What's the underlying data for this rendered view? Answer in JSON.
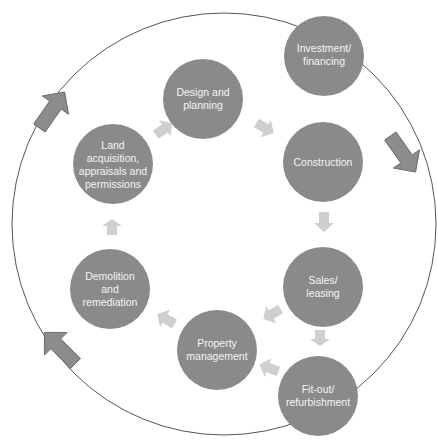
{
  "diagram": {
    "type": "cycle",
    "colors": {
      "node_fill": "#8a8a8a",
      "outer_ring": "#555555",
      "big_arrow_fill": "#8c8c8c",
      "big_arrow_stroke": "#5e5e5e",
      "small_arrow_fill": "#cfcfcf",
      "label_text": "#f4f4f4"
    },
    "nodes": [
      {
        "id": "investment",
        "lines": [
          "Investment/",
          "financing"
        ]
      },
      {
        "id": "design",
        "lines": [
          "Design and",
          "planning"
        ]
      },
      {
        "id": "construction",
        "lines": [
          "Construction"
        ]
      },
      {
        "id": "land",
        "lines": [
          "Land",
          "acquisition,",
          "appraisals and",
          "permissions"
        ]
      },
      {
        "id": "demolition",
        "lines": [
          "Demolition",
          "and",
          "remediation"
        ]
      },
      {
        "id": "property",
        "lines": [
          "Property",
          "management"
        ]
      },
      {
        "id": "sales",
        "lines": [
          "Sales/",
          "leasing"
        ]
      },
      {
        "id": "fitout",
        "lines": [
          "Fit-out/",
          "refurbishment"
        ]
      }
    ],
    "flows": [
      {
        "from": "land",
        "to": "design"
      },
      {
        "from": "design",
        "to": "construction"
      },
      {
        "from": "construction",
        "to": "sales"
      },
      {
        "from": "sales",
        "to": "fitout"
      },
      {
        "from": "sales",
        "to": "property"
      },
      {
        "from": "fitout",
        "to": "property"
      },
      {
        "from": "property",
        "to": "demolition"
      },
      {
        "from": "demolition",
        "to": "land"
      }
    ],
    "outer_cycle_direction": "clockwise"
  }
}
